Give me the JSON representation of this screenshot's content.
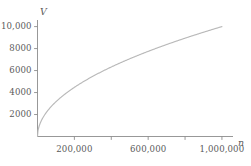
{
  "chart_data": {
    "type": "line",
    "title": "",
    "subtitle": "",
    "xlabel": "n",
    "ylabel": "V",
    "xlim": [
      0,
      1060000
    ],
    "ylim": [
      0,
      10600
    ],
    "grid": false,
    "legend": null,
    "annotations": [],
    "x_ticks": [
      {
        "value": 200000,
        "label": "200,000",
        "labeled": true
      },
      {
        "value": 400000,
        "label": "",
        "labeled": false
      },
      {
        "value": 600000,
        "label": "600,000",
        "labeled": true
      },
      {
        "value": 800000,
        "label": "",
        "labeled": false
      },
      {
        "value": 1000000,
        "label": "1,000,000",
        "labeled": true
      }
    ],
    "y_ticks": [
      {
        "value": 2000,
        "label": "2000",
        "labeled": true
      },
      {
        "value": 4000,
        "label": "4000",
        "labeled": true
      },
      {
        "value": 6000,
        "label": "6000",
        "labeled": true
      },
      {
        "value": 8000,
        "label": "8000",
        "labeled": true
      },
      {
        "value": 10000,
        "label": "10,000",
        "labeled": true
      }
    ],
    "series": [
      {
        "name": "V(n) = 10*sqrt(n)",
        "color": "#b9b9b9",
        "x": [
          0,
          2500,
          10000,
          22500,
          40000,
          62500,
          90000,
          122500,
          160000,
          200000,
          250000,
          300000,
          360000,
          420000,
          490000,
          560000,
          640000,
          720000,
          810000,
          900000,
          1000000
        ],
        "y": [
          0,
          500,
          1000,
          1500,
          2000,
          2500,
          3000,
          3500,
          4000,
          4472,
          5000,
          5477,
          6000,
          6481,
          7000,
          7483,
          8000,
          8485,
          9000,
          9487,
          10000
        ]
      }
    ]
  },
  "axis_labels": {
    "x_name": "n",
    "y_name": "V"
  },
  "colors": {
    "background": "#ffffff",
    "axis": "#8c8c8c",
    "curve": "#b9b9b9",
    "text": "#5a5a5a"
  }
}
